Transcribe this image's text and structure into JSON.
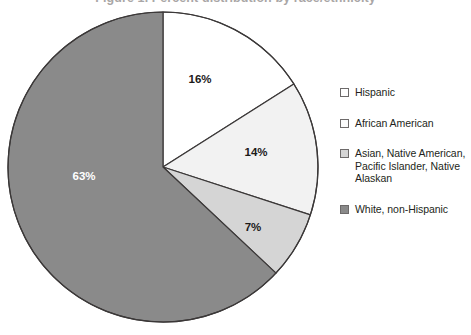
{
  "figure": {
    "title_partial": "Figure 1. Percent distribution by race/ethnicity",
    "background_color": "#ffffff"
  },
  "chart_data": {
    "type": "pie",
    "title": "",
    "xlabel": "",
    "ylabel": "",
    "legend_position": "right",
    "grid": false,
    "start_angle_deg": 0,
    "direction": "clockwise",
    "categories": [
      "Hispanic",
      "African American",
      "Asian, Native American, Pacific Islander, Native Alaskan",
      "White, non-Hispanic"
    ],
    "values": [
      16,
      14,
      7,
      63
    ],
    "value_labels": [
      "16%",
      "14%",
      "7%",
      "63%"
    ],
    "colors": [
      "#ffffff",
      "#f2f2f2",
      "#d5d5d5",
      "#8a8a8a"
    ],
    "slice_border_color": "#3b3838",
    "label_text_colors": [
      "#1c1a1a",
      "#1c1a1a",
      "#1c1a1a",
      "#ffffff"
    ]
  },
  "pie": {
    "center_x": 163,
    "center_y": 167,
    "radius": 155,
    "slices": [
      {
        "name": "hispanic",
        "label": "16%",
        "value": 16,
        "color": "#ffffff",
        "label_x": 200,
        "label_y": 83,
        "label_on_dark": false
      },
      {
        "name": "african-american",
        "label": "14%",
        "value": 14,
        "color": "#f2f2f2",
        "label_x": 256,
        "label_y": 156,
        "label_on_dark": false
      },
      {
        "name": "asian-native-american-pacific-islander-native-alaskan",
        "label": "7%",
        "value": 7,
        "color": "#d5d5d5",
        "label_x": 253,
        "label_y": 231,
        "label_on_dark": false
      },
      {
        "name": "white-non-hispanic",
        "label": "63%",
        "value": 63,
        "color": "#8a8a8a",
        "label_x": 84,
        "label_y": 180,
        "label_on_dark": true
      }
    ]
  },
  "legend": {
    "items": [
      {
        "label": "Hispanic",
        "color": "#ffffff"
      },
      {
        "label": "African American",
        "color": "#fbfbfb"
      },
      {
        "label": "Asian, Native American, Pacific Islander, Native Alaskan",
        "color": "#d5d5d5"
      },
      {
        "label": "White, non-Hispanic",
        "color": "#8a8a8a"
      }
    ]
  }
}
